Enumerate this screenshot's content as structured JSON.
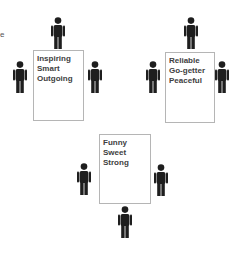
{
  "edge_fragment": "e",
  "groups": [
    {
      "traits": [
        "Inspiring",
        "Smart",
        "Outgoing"
      ],
      "box": {
        "x": 33,
        "y": 50,
        "w": 51,
        "h": 71
      },
      "people": [
        {
          "x": 51,
          "y": 17
        },
        {
          "x": 13,
          "y": 61
        },
        {
          "x": 88,
          "y": 61
        }
      ]
    },
    {
      "traits": [
        "Reliable",
        "Go-getter",
        "Peaceful"
      ],
      "box": {
        "x": 165,
        "y": 52,
        "w": 50,
        "h": 71
      },
      "people": [
        {
          "x": 184,
          "y": 17
        },
        {
          "x": 146,
          "y": 61
        },
        {
          "x": 215,
          "y": 61
        }
      ]
    },
    {
      "traits": [
        "Funny",
        "Sweet",
        "Strong"
      ],
      "box": {
        "x": 99,
        "y": 134,
        "w": 52,
        "h": 70
      },
      "people": [
        {
          "x": 77,
          "y": 163
        },
        {
          "x": 154,
          "y": 164
        },
        {
          "x": 118,
          "y": 206
        }
      ]
    }
  ],
  "colors": {
    "figure": "#1e1e1e",
    "border": "#b5b5b5",
    "text": "#404040"
  }
}
